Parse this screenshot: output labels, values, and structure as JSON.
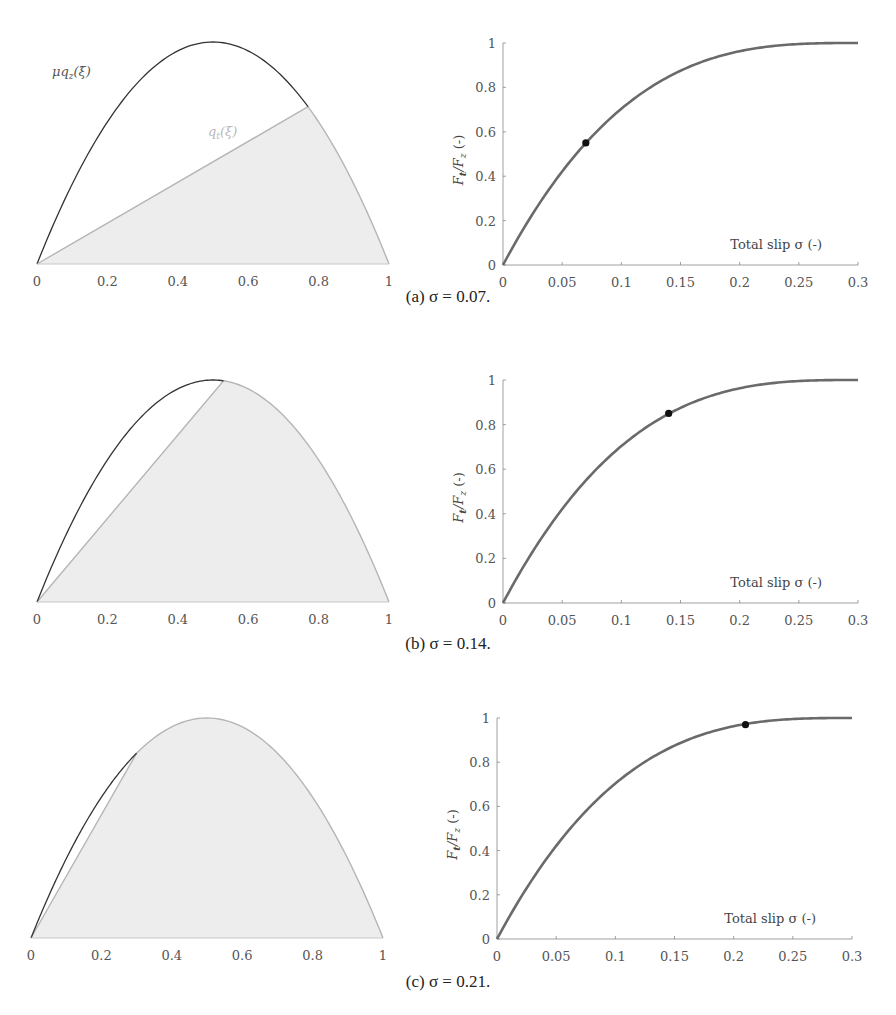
{
  "colors": {
    "mu_qz_curve": "#333333",
    "qt_curve": "#b5b5b5",
    "fill": "#ededed",
    "force_curve": "#6a6a6a",
    "marker": "#111111",
    "axis": "#888888"
  },
  "left_plot": {
    "x_ticks": [
      "0",
      "0.2",
      "0.4",
      "0.6",
      "0.8",
      "1"
    ],
    "label_mu_qz": "μq_z(ξ̄)",
    "label_qt": "q_t(ξ)"
  },
  "right_plot": {
    "x_ticks": [
      "0",
      "0.05",
      "0.1",
      "0.15",
      "0.2",
      "0.25",
      "0.3"
    ],
    "y_ticks": [
      "0",
      "0.2",
      "0.4",
      "0.6",
      "0.8",
      "1"
    ],
    "xlabel": "Total slip σ (-)",
    "ylabel": "F_t/F_z (-)"
  },
  "panels": [
    {
      "id": "a",
      "caption": "(a)  σ = 0.07.",
      "sigma": 0.07,
      "marker_y": 0.55,
      "transition_xi": 0.77
    },
    {
      "id": "b",
      "caption": "(b)  σ = 0.14.",
      "sigma": 0.14,
      "marker_y": 0.85,
      "transition_xi": 0.53
    },
    {
      "id": "c",
      "caption": "(c)  σ = 0.21.",
      "sigma": 0.21,
      "marker_y": 0.97,
      "transition_xi": 0.3
    }
  ],
  "chart_data": [
    {
      "type": "area",
      "title": "(a) σ = 0.07 — contact pressure distribution",
      "x": [
        0,
        0.2,
        0.4,
        0.6,
        0.77,
        0.8,
        1.0
      ],
      "series": [
        {
          "name": "μq_z(ξ̄)",
          "values": [
            0,
            0.64,
            0.96,
            0.96,
            0.71,
            0.64,
            0
          ]
        },
        {
          "name": "q_t(ξ)",
          "values": [
            0,
            0.18,
            0.37,
            0.55,
            0.71,
            0.64,
            0
          ]
        }
      ],
      "xlabel": "",
      "ylabel": "",
      "xlim": [
        0,
        1
      ],
      "ylim": [
        0,
        1
      ],
      "grid": false
    },
    {
      "type": "line",
      "title": "(a) σ = 0.07 — force vs slip",
      "x": [
        0,
        0.05,
        0.07,
        0.1,
        0.15,
        0.2,
        0.25,
        0.3
      ],
      "series": [
        {
          "name": "F_t/F_z",
          "values": [
            0,
            0.42,
            0.55,
            0.7,
            0.875,
            0.963,
            0.995,
            1.0
          ]
        }
      ],
      "annotations": [
        {
          "x": 0.07,
          "y": 0.55,
          "marker": "dot"
        }
      ],
      "xlabel": "Total slip σ (-)",
      "ylabel": "F_t/F_z (-)",
      "xlim": [
        0,
        0.3
      ],
      "ylim": [
        0,
        1
      ],
      "grid": false
    },
    {
      "type": "area",
      "title": "(b) σ = 0.14 — contact pressure distribution",
      "x": [
        0,
        0.2,
        0.4,
        0.53,
        0.6,
        0.8,
        1.0
      ],
      "series": [
        {
          "name": "μq_z(ξ̄)",
          "values": [
            0,
            0.64,
            0.96,
            0.996,
            0.96,
            0.64,
            0
          ]
        },
        {
          "name": "q_t(ξ)",
          "values": [
            0,
            0.38,
            0.75,
            0.996,
            0.96,
            0.64,
            0
          ]
        }
      ],
      "xlabel": "",
      "ylabel": "",
      "xlim": [
        0,
        1
      ],
      "ylim": [
        0,
        1
      ],
      "grid": false
    },
    {
      "type": "line",
      "title": "(b) σ = 0.14 — force vs slip",
      "x": [
        0,
        0.05,
        0.1,
        0.14,
        0.15,
        0.2,
        0.25,
        0.3
      ],
      "series": [
        {
          "name": "F_t/F_z",
          "values": [
            0,
            0.42,
            0.7,
            0.85,
            0.875,
            0.963,
            0.995,
            1.0
          ]
        }
      ],
      "annotations": [
        {
          "x": 0.14,
          "y": 0.85,
          "marker": "dot"
        }
      ],
      "xlabel": "Total slip σ (-)",
      "ylabel": "F_t/F_z (-)",
      "xlim": [
        0,
        0.3
      ],
      "ylim": [
        0,
        1
      ],
      "grid": false
    },
    {
      "type": "area",
      "title": "(c) σ = 0.21 — contact pressure distribution",
      "x": [
        0,
        0.2,
        0.3,
        0.4,
        0.6,
        0.8,
        1.0
      ],
      "series": [
        {
          "name": "μq_z(ξ̄)",
          "values": [
            0,
            0.64,
            0.84,
            0.96,
            0.96,
            0.64,
            0
          ]
        },
        {
          "name": "q_t(ξ)",
          "values": [
            0,
            0.56,
            0.84,
            0.96,
            0.96,
            0.64,
            0
          ]
        }
      ],
      "xlabel": "",
      "ylabel": "",
      "xlim": [
        0,
        1
      ],
      "ylim": [
        0,
        1
      ],
      "grid": false
    },
    {
      "type": "line",
      "title": "(c) σ = 0.21 — force vs slip",
      "x": [
        0,
        0.05,
        0.1,
        0.15,
        0.2,
        0.21,
        0.25,
        0.3
      ],
      "series": [
        {
          "name": "F_t/F_z",
          "values": [
            0,
            0.42,
            0.7,
            0.875,
            0.963,
            0.97,
            0.995,
            1.0
          ]
        }
      ],
      "annotations": [
        {
          "x": 0.21,
          "y": 0.97,
          "marker": "dot"
        }
      ],
      "xlabel": "Total slip σ (-)",
      "ylabel": "F_t/F_z (-)",
      "xlim": [
        0,
        0.3
      ],
      "ylim": [
        0,
        1
      ],
      "grid": false
    }
  ]
}
